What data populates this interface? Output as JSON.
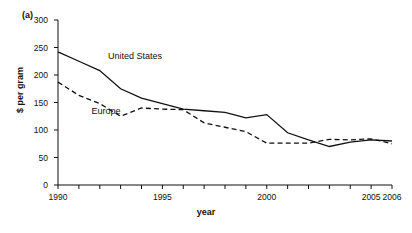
{
  "figure": {
    "panel_tag": "(a)"
  },
  "chart_data": {
    "type": "line",
    "title": "",
    "subtitle": "",
    "xlabel": "year",
    "ylabel": "$ per gram",
    "xlim": [
      1990,
      2006
    ],
    "ylim": [
      0,
      300
    ],
    "grid": false,
    "legend_position": "inline-annotations",
    "x": [
      1990,
      1991,
      1992,
      1993,
      1994,
      1995,
      1996,
      1997,
      1998,
      1999,
      2000,
      2001,
      2002,
      2003,
      2004,
      2005,
      2006
    ],
    "x_tick_values": [
      1990,
      1991,
      1992,
      1993,
      1994,
      1995,
      1996,
      1997,
      1998,
      1999,
      2000,
      2001,
      2002,
      2003,
      2004,
      2005,
      2006
    ],
    "x_tick_labels": [
      "1990",
      "",
      "",
      "",
      "",
      "1995",
      "",
      "",
      "",
      "",
      "2000",
      "",
      "",
      "",
      "",
      "2005",
      "2006"
    ],
    "y_tick_values": [
      0,
      50,
      100,
      150,
      200,
      250,
      300
    ],
    "y_tick_labels": [
      "0",
      "50",
      "100",
      "150",
      "200",
      "250",
      "300"
    ],
    "series": [
      {
        "name": "United States",
        "style": "solid",
        "color": "#111111",
        "label_text": "United States",
        "values": [
          242,
          225,
          208,
          175,
          158,
          148,
          138,
          135,
          132,
          122,
          128,
          95,
          82,
          70,
          78,
          82,
          80
        ]
      },
      {
        "name": "Europe",
        "style": "dashed",
        "color": "#111111",
        "label_text": "Europe",
        "values": [
          187,
          163,
          148,
          125,
          140,
          138,
          137,
          113,
          105,
          97,
          76,
          76,
          76,
          83,
          82,
          84,
          75
        ]
      }
    ],
    "annotations": [
      {
        "text": "United States",
        "x": 1992.4,
        "y": 232
      },
      {
        "text": "Europe",
        "x": 1991.6,
        "y": 133
      }
    ]
  }
}
